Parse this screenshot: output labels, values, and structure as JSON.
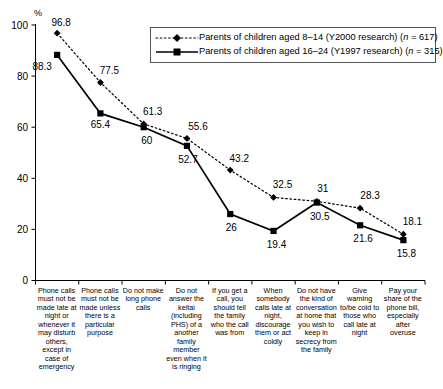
{
  "chart_data": {
    "type": "line",
    "title": "",
    "xlabel": "",
    "ylabel": "%",
    "ylim": [
      0,
      100
    ],
    "yticks": [
      0,
      20,
      40,
      60,
      80,
      100
    ],
    "grid": false,
    "legend_position": "top-right",
    "categories": [
      "Phone calls must not be made late at night or whenever it may disturb others, except in case of emergency",
      "Phone calls must not be made unless there is a particular purpose",
      "Do not make long phone calls",
      "Do not answer the keitai (including PHS) of a another family member even when it is ringing",
      "If you get a call, you should tell the family who the call was from",
      "When somebody calls late at night, discourage them or act coldly",
      "Do not have the kind of conversation at home that you wish to keep in secrecy from the family",
      "Give warning to/be cold to those who call late at night",
      "Pay your share of the phone bill, especially after overuse"
    ],
    "series": [
      {
        "name": "Parents of children aged 8–14 (Y2000 research) (n = 617)",
        "marker": "diamond",
        "line_style": "dotted",
        "values": [
          96.8,
          77.5,
          61.3,
          55.6,
          43.2,
          32.5,
          31,
          28.3,
          18.1
        ]
      },
      {
        "name": "Parents of children aged 16–24 (Y1997 research) (n = 315)",
        "marker": "square",
        "line_style": "solid",
        "values": [
          88.3,
          65.4,
          60,
          52.7,
          26,
          19.4,
          30.5,
          21.6,
          15.8
        ]
      }
    ]
  },
  "axis": {
    "unit_label": "%",
    "ytick_labels": [
      "100",
      "80",
      "60",
      "40",
      "20",
      "0"
    ]
  },
  "legend": {
    "rows": [
      {
        "label_main": "Parents of children aged 8–14 (Y2000 research) (",
        "label_n": "n",
        "label_tail": " = 617)"
      },
      {
        "label_main": "Parents of children aged 16–24 (Y1997 research) (",
        "label_n": "n",
        "label_tail": " = 315)"
      }
    ]
  },
  "data_labels": {
    "series1": [
      "96.8",
      "77.5",
      "61.3",
      "55.6",
      "43.2",
      "32.5",
      "31",
      "28.3",
      "18.1"
    ],
    "series2": [
      "88.3",
      "65.4",
      "60",
      "52.7",
      "26",
      "19.4",
      "30.5",
      "21.6",
      "15.8"
    ]
  },
  "categories_display": [
    "Phone calls must not be made late at night or whenever it may disturb others, except in case of emergency",
    "Phone calls must not be made unless there is a particular purpose",
    "Do not make long phone calls",
    "Do not answer the keitai (including PHS) of a another family member even when it is ringing",
    "If you get a call, you should tell the family who the call was from",
    "When somebody calls late at night, discourage them or act coldly",
    "Do not have the kind of conversation at home that you wish to keep in secrecy from the family",
    "Give warning to/be cold to those who call late at night",
    "Pay your share of the phone bill, especially after overuse"
  ]
}
